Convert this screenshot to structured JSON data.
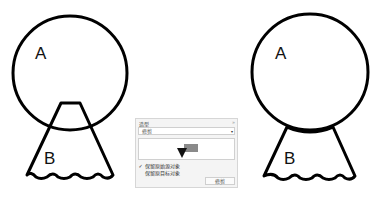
{
  "before": {
    "shape_a_label": "A",
    "shape_b_label": "B"
  },
  "after": {
    "shape_a_label": "A",
    "shape_b_label": "B"
  },
  "docker": {
    "title": "造型",
    "collapse_icon": "»",
    "operation_dropdown": {
      "value": "修剪",
      "arrow": "▾"
    },
    "preview_icon": "trim-preview-icon",
    "options": [
      {
        "label": "保留原始源对象",
        "checked": true,
        "mark": "✓"
      },
      {
        "label": "保留原目标对象",
        "checked": false,
        "mark": ""
      }
    ],
    "apply_button": "修剪"
  }
}
